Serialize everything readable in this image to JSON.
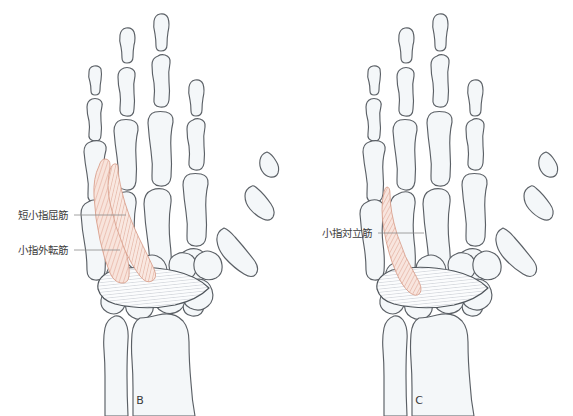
{
  "figure": {
    "background_color": "#ffffff",
    "bone_fill": "#f4f7f9",
    "bone_stroke": "#5b6066",
    "muscle_fill": "#f6ded6",
    "muscle_stroke": "#d9a08d",
    "muscle_striation": "#e2a694",
    "retinaculum_fill": "#fbfcfd",
    "retinaculum_stroke": "#4e545a",
    "retinaculum_striation": "#b9bfc6",
    "label_color": "#3c3c3c",
    "leader_color": "#8a8a8a"
  },
  "panels": [
    {
      "id": "panel-b",
      "letter": "B",
      "letter_x": 140,
      "letter_y": 404,
      "annotations": [
        {
          "id": "flexor-digiti-minimi-brevis",
          "label": "短小指屈筋",
          "text_x": 68,
          "text_y": 219,
          "leader_x1": 74,
          "leader_y1": 215,
          "leader_x2": 126,
          "leader_y2": 215
        },
        {
          "id": "abductor-digiti-minimi",
          "label": "小指外転筋",
          "text_x": 68,
          "text_y": 254,
          "leader_x1": 74,
          "leader_y1": 250,
          "leader_x2": 120,
          "leader_y2": 250
        }
      ]
    },
    {
      "id": "panel-c",
      "letter": "C",
      "letter_x": 419,
      "letter_y": 404,
      "annotations": [
        {
          "id": "opponens-digiti-minimi",
          "label": "小指対立筋",
          "text_x": 372,
          "text_y": 237,
          "leader_x1": 378,
          "leader_y1": 233,
          "leader_x2": 424,
          "leader_y2": 233
        }
      ]
    }
  ]
}
